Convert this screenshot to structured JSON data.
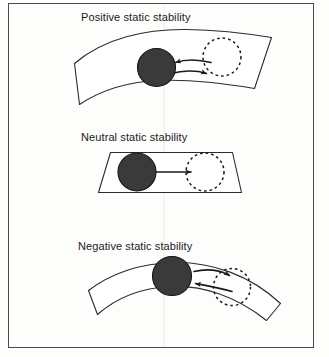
{
  "figure": {
    "width": 329,
    "height": 357,
    "background_color": "#fdfdfc",
    "border_color": "#4a4a4a",
    "caption_font_size": 11
  },
  "colors": {
    "ball_fill": "#3a3a3a",
    "ball_stroke": "#151515",
    "surface_stroke": "#2b2b2b",
    "dashed_stroke": "#1a1a1a",
    "arrow_stroke": "#1a1a1a",
    "text": "#1a1a1a"
  },
  "panels": [
    {
      "id": "positive",
      "title": "Positive static stability",
      "surface_type": "concave-bowl",
      "ball_label": "displaced-ball",
      "ghost_label": "original-position",
      "arrow_directions": [
        "left",
        "right"
      ],
      "meaning": "ball returns toward original position"
    },
    {
      "id": "neutral",
      "title": "Neutral static stability",
      "surface_type": "flat-plane",
      "ball_label": "displaced-ball",
      "ghost_label": "original-position",
      "arrow_directions": [
        "right"
      ],
      "meaning": "ball remains at new position"
    },
    {
      "id": "negative",
      "title": "Negative static stability",
      "surface_type": "convex-dome",
      "ball_label": "displaced-ball",
      "ghost_label": "original-position",
      "arrow_directions": [
        "right",
        "left"
      ],
      "meaning": "ball diverges away from original position"
    }
  ],
  "icons": {
    "ball": "filled-circle-icon",
    "ghost_ball": "dashed-circle-icon",
    "arrow": "arrow-icon"
  }
}
